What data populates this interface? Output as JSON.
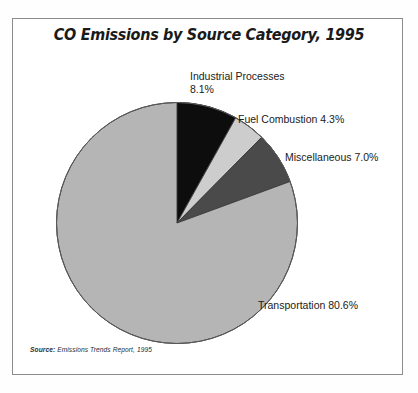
{
  "chart_data": {
    "type": "pie",
    "title": "CO Emissions by Source Category, 1995",
    "xlabel": "",
    "ylabel": "",
    "legend_position": "none",
    "grid": false,
    "categories": [
      "Industrial Processes",
      "Fuel Combustion",
      "Miscellaneous",
      "Transportation"
    ],
    "values": [
      8.1,
      4.3,
      7.0,
      80.6
    ],
    "units": "percent",
    "start_angle_deg": 0,
    "direction": "clockwise",
    "slices": [
      {
        "label": "Industrial Processes",
        "value": 8.1,
        "value_text": "8.1%",
        "color": "#0d0d0d"
      },
      {
        "label": "Fuel Combustion",
        "value": 4.3,
        "value_text": "4.3%",
        "color": "#cdcdcd"
      },
      {
        "label": "Miscellaneous",
        "value": 7.0,
        "value_text": "7.0%",
        "color": "#4a4a4a"
      },
      {
        "label": "Transportation",
        "value": 80.6,
        "value_text": "80.6%",
        "color": "#b5b5b5"
      }
    ],
    "annotations": {
      "industrial_line1": "Industrial Processes",
      "industrial_line2": "8.1%",
      "fuel": "Fuel Combustion 4.3%",
      "miscellaneous": "Miscellaneous 7.0%",
      "transportation": "Transportation 80.6%"
    },
    "source_prefix": "Source:",
    "source_text": "Emissions Trends Report, 1995"
  },
  "colors": {
    "frame_border": "#8c8c8c",
    "background": "#ffffff",
    "text": "#212121",
    "slice_outline": "#3a3a3a"
  }
}
